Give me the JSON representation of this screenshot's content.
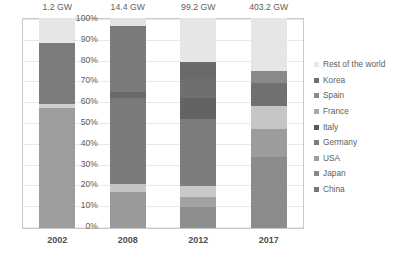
{
  "chart_data": {
    "type": "bar",
    "subtype": "stacked-100-percent",
    "title": "",
    "xlabel": "",
    "ylabel": "",
    "ylim": [
      0,
      100
    ],
    "grid": true,
    "legend_position": "right",
    "categories": [
      "2002",
      "2008",
      "2012",
      "2017"
    ],
    "bar_totals": [
      "1.2 GW",
      "14.4 GW",
      "99.2 GW",
      "403.2 GW"
    ],
    "ytick_labels": [
      "100%",
      "90%",
      "80%",
      "70%",
      "60%",
      "50%",
      "40%",
      "30%",
      "20%",
      "10%",
      "0%"
    ],
    "ytick_values": [
      100,
      90,
      80,
      70,
      60,
      50,
      40,
      30,
      20,
      10,
      0
    ],
    "legend_entries": [
      {
        "name": "Rest of the world",
        "color": "#e8e8e8"
      },
      {
        "name": "Korea",
        "color": "#6f6f6f"
      },
      {
        "name": "Spain",
        "color": "#8a8a8a"
      },
      {
        "name": "France",
        "color": "#a8a8a8"
      },
      {
        "name": "Italy",
        "color": "#5a5a5a"
      },
      {
        "name": "Germany",
        "color": "#7d7d7d"
      },
      {
        "name": "USA",
        "color": "#9e9e9e"
      },
      {
        "name": "Japan",
        "color": "#888888"
      },
      {
        "name": "China",
        "color": "#757575"
      }
    ],
    "stack_order_bottom_to_top": [
      "China",
      "Japan",
      "USA",
      "Germany",
      "Italy",
      "France",
      "Spain",
      "Korea",
      "Rest of the world"
    ],
    "series": [
      {
        "name": "China",
        "color": "#757575",
        "values": [
          0,
          0,
          15,
          34
        ]
      },
      {
        "name": "Japan",
        "color": "#888888",
        "values": [
          0,
          17,
          5,
          12
        ]
      },
      {
        "name": "USA",
        "color": "#9e9e9e",
        "values": [
          57,
          4,
          6,
          9
        ]
      },
      {
        "name": "Germany",
        "color": "#7d7d7d",
        "values": [
          0,
          41,
          39,
          12
        ]
      },
      {
        "name": "Italy",
        "color": "#5a5a5a",
        "values": [
          0,
          2,
          7,
          8
        ]
      },
      {
        "name": "France",
        "color": "#a8a8a8",
        "values": [
          2,
          0,
          0,
          0
        ]
      },
      {
        "name": "Spain",
        "color": "#8a8a8a",
        "values": [
          29,
          32,
          7,
          0
        ]
      },
      {
        "name": "Korea",
        "color": "#6f6f6f",
        "values": [
          0,
          0,
          0,
          0
        ]
      },
      {
        "name": "Rest of the world",
        "color": "#e8e8e8",
        "values": [
          12,
          4,
          21,
          25
        ]
      }
    ],
    "bars": [
      {
        "category": "2002",
        "total": "1.2 GW",
        "segments": [
          {
            "name": "USA",
            "start": 0,
            "end": 57,
            "color": "#9e9e9e"
          },
          {
            "name": "France",
            "start": 57,
            "end": 59,
            "color": "#cfcfcf"
          },
          {
            "name": "Spain",
            "start": 59,
            "end": 88,
            "color": "#7c7c7c"
          },
          {
            "name": "Rest of the world",
            "start": 88,
            "end": 100,
            "color": "#e6e6e6"
          }
        ]
      },
      {
        "category": "2008",
        "total": "14.4 GW",
        "segments": [
          {
            "name": "Japan",
            "start": 0,
            "end": 17,
            "color": "#9a9a9a"
          },
          {
            "name": "USA",
            "start": 17,
            "end": 21,
            "color": "#c4c4c4"
          },
          {
            "name": "Germany",
            "start": 21,
            "end": 62,
            "color": "#7b7b7b"
          },
          {
            "name": "Italy",
            "start": 62,
            "end": 65,
            "color": "#6a6a6a"
          },
          {
            "name": "Spain",
            "start": 65,
            "end": 96,
            "color": "#7b7b7b"
          },
          {
            "name": "Rest of the world",
            "start": 96,
            "end": 100,
            "color": "#e2e2e2"
          }
        ]
      },
      {
        "category": "2012",
        "total": "99.2 GW",
        "segments": [
          {
            "name": "China",
            "start": 0,
            "end": 10,
            "color": "#8e8e8e"
          },
          {
            "name": "Japan",
            "start": 10,
            "end": 15,
            "color": "#a3a3a3"
          },
          {
            "name": "USA",
            "start": 15,
            "end": 20,
            "color": "#c9c9c9"
          },
          {
            "name": "Germany",
            "start": 20,
            "end": 52,
            "color": "#7d7d7d"
          },
          {
            "name": "Italy",
            "start": 52,
            "end": 62,
            "color": "#636363"
          },
          {
            "name": "Spain",
            "start": 62,
            "end": 71,
            "color": "#6f6f6f"
          },
          {
            "name": "Korea",
            "start": 71,
            "end": 79,
            "color": "#6a6a6a"
          },
          {
            "name": "Rest of the world",
            "start": 79,
            "end": 100,
            "color": "#e6e6e6"
          }
        ]
      },
      {
        "category": "2017",
        "total": "403.2 GW",
        "segments": [
          {
            "name": "China",
            "start": 0,
            "end": 34,
            "color": "#8b8b8b"
          },
          {
            "name": "Japan",
            "start": 34,
            "end": 47,
            "color": "#9c9c9c"
          },
          {
            "name": "USA",
            "start": 47,
            "end": 58,
            "color": "#c6c6c6"
          },
          {
            "name": "Germany",
            "start": 58,
            "end": 69,
            "color": "#707070"
          },
          {
            "name": "Italy",
            "start": 69,
            "end": 75,
            "color": "#8a8a8a"
          },
          {
            "name": "Rest of the world",
            "start": 75,
            "end": 100,
            "color": "#e6e6e6"
          }
        ]
      }
    ]
  }
}
